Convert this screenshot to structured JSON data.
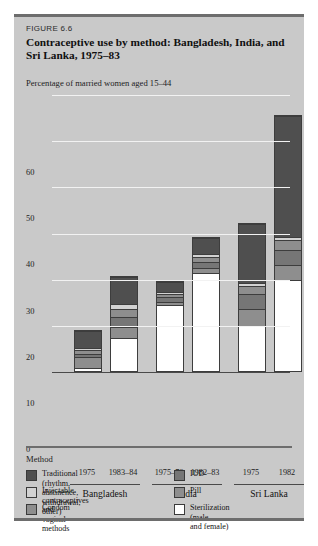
{
  "figure": {
    "number_label": "FIGURE 6.6",
    "title": "Contraceptive use by method: Bangladesh, India, and Sri Lanka, 1975–83",
    "subtitle": "Percentage of married women aged 15–44"
  },
  "legend": {
    "heading": "Method",
    "items": [
      {
        "label": "Traditional (rhythm, abstinence,\nwithdrawal, other)",
        "color": "#4f4f4f"
      },
      {
        "label": "Injectable contraceptives and\nvaginal methods",
        "color": "#d2d2d2"
      },
      {
        "label": "Condom",
        "color": "#8e8e8e"
      },
      {
        "label": "IUD",
        "color": "#767676"
      },
      {
        "label": "Pill",
        "color": "#8e8e8e"
      },
      {
        "label": "Sterilization (male\nand female)",
        "color": "#ffffff"
      }
    ]
  },
  "chart_data": {
    "type": "bar",
    "subtype": "stacked",
    "title": "Contraceptive use by method: Bangladesh, India, and Sri Lanka, 1975–83",
    "xlabel": "",
    "ylabel": "Percentage of married women aged 15–44",
    "ylim": [
      0,
      60
    ],
    "yticks": [
      0,
      10,
      20,
      30,
      40,
      50,
      60
    ],
    "grid": true,
    "legend_position": "bottom",
    "categories": [
      "1975",
      "1983–84",
      "1975–76",
      "1982–83",
      "1975",
      "1982"
    ],
    "groups": [
      {
        "name": "Bangladesh",
        "categories": [
          "1975",
          "1983–84"
        ]
      },
      {
        "name": "India",
        "categories": [
          "1975–76",
          "1982–83"
        ]
      },
      {
        "name": "Sri Lanka",
        "categories": [
          "1975",
          "1982"
        ]
      }
    ],
    "series": [
      {
        "name": "Sterilization (male and female)",
        "color": "#ffffff",
        "values": [
          0.5,
          7.0,
          14.0,
          21.0,
          9.5,
          19.5
        ]
      },
      {
        "name": "Pill",
        "color": "#8e8e8e",
        "values": [
          2.0,
          2.0,
          0.6,
          0.8,
          3.5,
          3.0
        ]
      },
      {
        "name": "IUD",
        "color": "#767676",
        "values": [
          0.5,
          2.0,
          0.7,
          1.2,
          3.0,
          3.0
        ]
      },
      {
        "name": "Condom",
        "color": "#8e8e8e",
        "values": [
          0.7,
          1.5,
          0.5,
          0.8,
          1.5,
          2.0
        ]
      },
      {
        "name": "Injectable contraceptives and vaginal methods",
        "color": "#d2d2d2",
        "values": [
          0.3,
          1.0,
          0.2,
          0.4,
          0.5,
          0.5
        ]
      },
      {
        "name": "Traditional (rhythm, abstinence, withdrawal, other)",
        "color": "#4f4f4f",
        "values": [
          3.3,
          5.5,
          2.0,
          3.3,
          12.5,
          26.0
        ]
      }
    ],
    "totals": [
      7.3,
      19.0,
      18.0,
      27.5,
      30.5,
      54.0
    ]
  }
}
